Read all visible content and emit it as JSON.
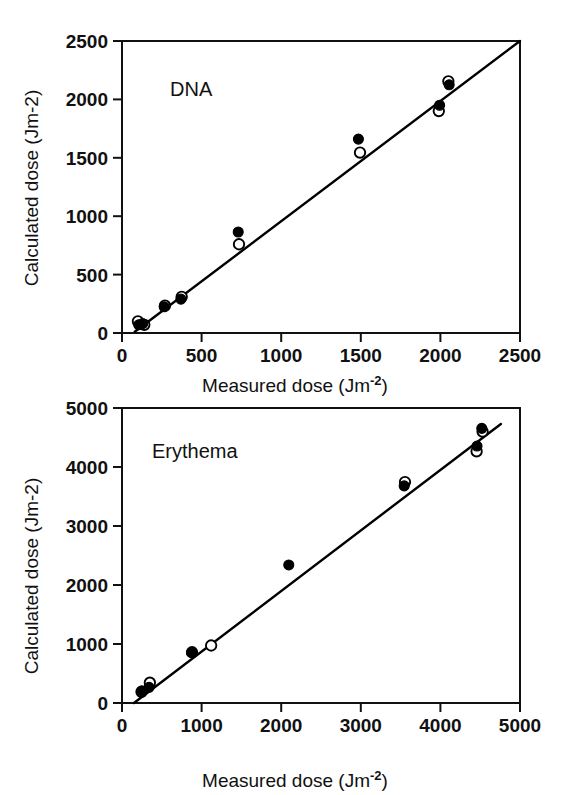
{
  "figure": {
    "background": "#ffffff",
    "ink_color": "#000000",
    "width": 573,
    "height": 795
  },
  "chart_data": [
    {
      "id": "dna",
      "type": "scatter",
      "title": "",
      "annotation": "DNA",
      "xlabel_main": "Measured dose (Jm",
      "xlabel_sup": "-2",
      "xlabel_tail": ")",
      "ylabel_main": "Calculated dose (Jm",
      "ylabel_sup": "-2",
      "ylabel_tail": ")",
      "xlim": [
        0,
        2500
      ],
      "ylim": [
        0,
        2500
      ],
      "xticks": [
        0,
        500,
        1000,
        1500,
        2000,
        2500
      ],
      "yticks": [
        0,
        500,
        1000,
        1500,
        2000,
        2500
      ],
      "xticklabels": [
        "0",
        "500",
        "1000",
        "1500",
        "2000",
        "2500"
      ],
      "yticklabels": [
        "0",
        "500",
        "1000",
        "1500",
        "2000",
        "2500"
      ],
      "grid": false,
      "legend": "none",
      "fit_line": {
        "x": [
          80,
          2500
        ],
        "y": [
          10,
          2500
        ],
        "label": "1:1 regression line"
      },
      "series": [
        {
          "name": "filled",
          "marker": "filled-circle",
          "color": "#000000",
          "points": [
            [
              105,
              70
            ],
            [
              130,
              80
            ],
            [
              265,
              225
            ],
            [
              370,
              290
            ],
            [
              730,
              865
            ],
            [
              1485,
              1660
            ],
            [
              1995,
              1950
            ],
            [
              2055,
              2125
            ]
          ]
        },
        {
          "name": "open",
          "marker": "open-circle",
          "color": "#ffffff",
          "points": [
            [
              100,
              100
            ],
            [
              140,
              70
            ],
            [
              270,
              235
            ],
            [
              375,
              310
            ],
            [
              735,
              760
            ],
            [
              1495,
              1545
            ],
            [
              1990,
              1900
            ],
            [
              2050,
              2155
            ]
          ]
        }
      ]
    },
    {
      "id": "erythema",
      "type": "scatter",
      "title": "",
      "annotation": "Erythema",
      "xlabel_main": "Measured dose (Jm",
      "xlabel_sup": "-2",
      "xlabel_tail": ")",
      "ylabel_main": "Calculated dose (Jm",
      "ylabel_sup": "-2",
      "ylabel_tail": ")",
      "xlim": [
        0,
        5000
      ],
      "ylim": [
        0,
        5000
      ],
      "xticks": [
        0,
        1000,
        2000,
        3000,
        4000,
        5000
      ],
      "yticks": [
        0,
        1000,
        2000,
        3000,
        4000,
        5000
      ],
      "xticklabels": [
        "0",
        "1000",
        "2000",
        "3000",
        "4000",
        "5000"
      ],
      "yticklabels": [
        "0",
        "1000",
        "2000",
        "3000",
        "4000",
        "5000"
      ],
      "grid": false,
      "legend": "none",
      "fit_line": {
        "x": [
          150,
          4760
        ],
        "y": [
          0,
          4730
        ],
        "label": "1:1 regression line"
      },
      "series": [
        {
          "name": "filled",
          "marker": "filled-circle",
          "color": "#000000",
          "points": [
            [
              250,
              205
            ],
            [
              340,
              265
            ],
            [
              875,
              855
            ],
            [
              2095,
              2340
            ],
            [
              3545,
              3680
            ],
            [
              4460,
              4355
            ],
            [
              4520,
              4655
            ]
          ]
        },
        {
          "name": "open",
          "marker": "open-circle",
          "color": "#ffffff",
          "points": [
            [
              245,
              190
            ],
            [
              350,
              345
            ],
            [
              880,
              860
            ],
            [
              1120,
              975
            ],
            [
              3555,
              3745
            ],
            [
              4455,
              4265
            ],
            [
              4530,
              4600
            ]
          ]
        }
      ]
    }
  ]
}
